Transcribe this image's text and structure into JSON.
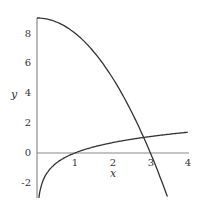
{
  "chart_data": {
    "type": "line",
    "title": "",
    "xlabel": "x",
    "ylabel": "y",
    "xlim": [
      0,
      4
    ],
    "ylim": [
      -3,
      9
    ],
    "xticks": [
      "1",
      "2",
      "3",
      "4"
    ],
    "yticks": [
      "-2",
      "0",
      "2",
      "4",
      "6",
      "8"
    ],
    "grid": false,
    "legend": null,
    "series": [
      {
        "name": "y = 9 - x^2",
        "x": [
          0,
          0.5,
          1,
          1.5,
          2,
          2.5,
          3,
          3.45
        ],
        "values": [
          9,
          8.75,
          8,
          6.75,
          5,
          2.75,
          0,
          -2.9
        ]
      },
      {
        "name": "y = ln x",
        "x": [
          0.05,
          0.1,
          0.25,
          0.5,
          1,
          2,
          3,
          4
        ],
        "values": [
          -3,
          -2.3,
          -1.39,
          -0.69,
          0,
          0.69,
          1.1,
          1.39
        ]
      }
    ],
    "color": "#333333"
  }
}
